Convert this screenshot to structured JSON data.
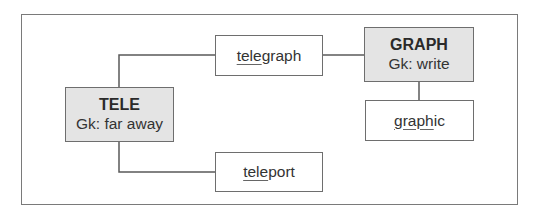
{
  "diagram": {
    "roots": [
      {
        "id": "tele",
        "title": "TELE",
        "gloss": "Gk: far away"
      },
      {
        "id": "graph",
        "title": "GRAPH",
        "gloss": "Gk: write"
      }
    ],
    "words": [
      {
        "id": "telegraph",
        "underlined": "tele",
        "rest": "graph",
        "text": "telegraph"
      },
      {
        "id": "graphic",
        "underlined": "graph",
        "rest": "ic",
        "text": "graphic"
      },
      {
        "id": "teleport",
        "underlined": "tele",
        "rest": "port",
        "text": "teleport"
      }
    ],
    "edges": [
      {
        "from": "tele",
        "to": "telegraph"
      },
      {
        "from": "telegraph",
        "to": "graph"
      },
      {
        "from": "graph",
        "to": "graphic"
      },
      {
        "from": "tele",
        "to": "teleport"
      }
    ],
    "colors": {
      "root_fill": "#e4e4e4",
      "word_fill": "#ffffff",
      "line": "#5a5a5a"
    }
  }
}
